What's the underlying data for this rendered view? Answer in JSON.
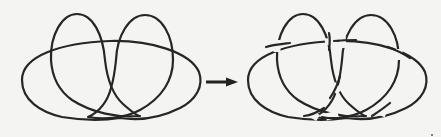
{
  "figure": {
    "type": "knot-diagram-transformation",
    "background_color": "#f4f4f2",
    "stroke_color": "#262626",
    "left_diagram": {
      "name": "knot-shadow",
      "description": "Projection without crossing information: a wide rounded loop overlaid with two tall lobes",
      "crossings_shown": false
    },
    "arrow": {
      "direction": "right",
      "meaning": "becomes"
    },
    "right_diagram": {
      "name": "knot-diagram",
      "description": "Same projection with over/under crossings indicated by gaps in the under-strands",
      "crossings_shown": true
    }
  }
}
